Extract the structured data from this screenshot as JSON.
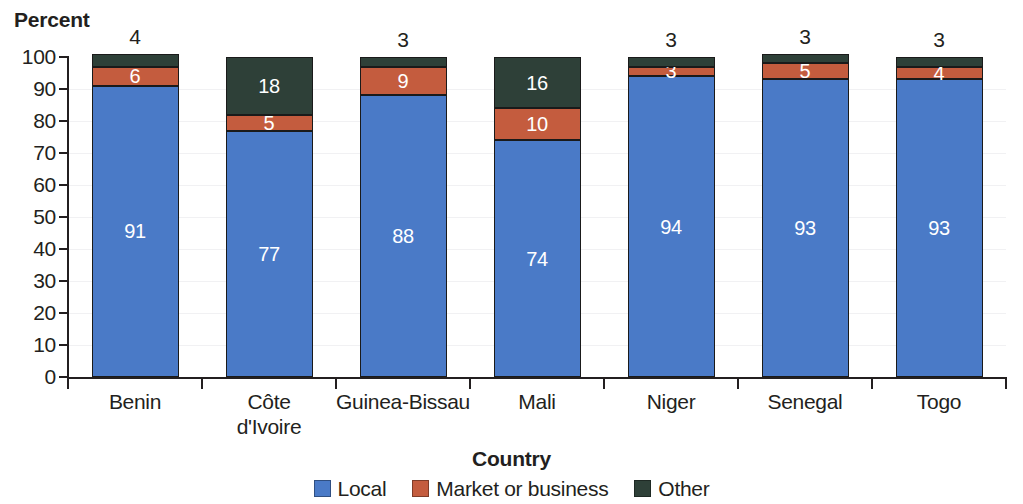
{
  "chart_data": {
    "type": "bar",
    "subtype": "stacked-column-100",
    "title": "",
    "xlabel": "Country",
    "ylabel": "Percent",
    "ylim": [
      0,
      100
    ],
    "ytick_step": 10,
    "ytick_labels": [
      "100",
      "90",
      "80",
      "70",
      "60",
      "50",
      "40",
      "30",
      "20",
      "10",
      "0"
    ],
    "grid": true,
    "legend_position": "bottom",
    "categories": [
      "Benin",
      "Côte d'Ivoire",
      "Guinea-Bissau",
      "Mali",
      "Niger",
      "Senegal",
      "Togo"
    ],
    "category_lines": [
      [
        "Benin"
      ],
      [
        "Côte",
        "d'Ivoire"
      ],
      [
        "Guinea-Bissau"
      ],
      [
        "Mali"
      ],
      [
        "Niger"
      ],
      [
        "Senegal"
      ],
      [
        "Togo"
      ]
    ],
    "series": [
      {
        "name": "Local",
        "color": "#4a7ac7",
        "values": [
          91,
          77,
          88,
          74,
          94,
          93,
          93
        ],
        "labels": [
          "91",
          "77",
          "88",
          "74",
          "94",
          "93",
          "93"
        ]
      },
      {
        "name": "Market or business",
        "color": "#c45c3e",
        "values": [
          6,
          5,
          9,
          10,
          3,
          5,
          4
        ],
        "labels": [
          "6",
          "5",
          "9",
          "10",
          "3",
          "5",
          "4"
        ]
      },
      {
        "name": "Other",
        "color": "#2e4038",
        "values": [
          4,
          18,
          3,
          16,
          3,
          3,
          3
        ],
        "labels": [
          "",
          "18",
          "",
          "16",
          "",
          "",
          ""
        ],
        "outside_labels": [
          "4",
          "",
          "3",
          "",
          "3",
          "3",
          "3"
        ]
      }
    ]
  },
  "axes": {
    "y_title": "Percent",
    "x_title": "Country"
  },
  "legend": {
    "items": [
      {
        "label": "Local",
        "color": "#4a7ac7",
        "icon": "legend-swatch-icon"
      },
      {
        "label": "Market or business",
        "color": "#c45c3e",
        "icon": "legend-swatch-icon"
      },
      {
        "label": "Other",
        "color": "#2e4038",
        "icon": "legend-swatch-icon"
      }
    ]
  }
}
